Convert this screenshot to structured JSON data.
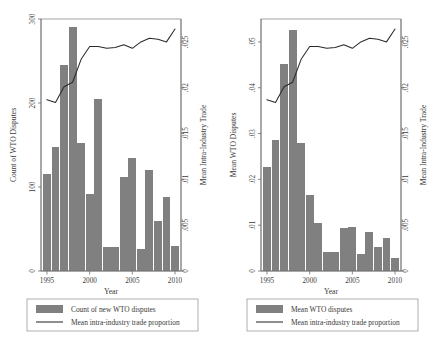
{
  "figure": {
    "background": "#ffffff",
    "bar_color": "#808080",
    "line_color": "#2a2a2a",
    "axis_color": "#6d6d6d"
  },
  "chart_data": [
    {
      "type": "bar",
      "id": "left-panel",
      "title": "",
      "xlabel": "Year",
      "ylabel": "Count of WTO Disputes",
      "y2label": "Mean Intra-Industry Trade",
      "grid": false,
      "legend_position": "below",
      "xlim": [
        1994.3,
        2010.7
      ],
      "ylim": [
        0,
        300
      ],
      "y2lim": [
        0,
        0.0275
      ],
      "xticks": [
        1995,
        2000,
        2005,
        2010
      ],
      "xticklabels": [
        "1995",
        "2000",
        "2005",
        "2010"
      ],
      "yticks": [
        0,
        100,
        200,
        300
      ],
      "yticklabels": [
        "0",
        "100",
        "200",
        "300"
      ],
      "y2ticks": [
        0,
        0.005,
        0.01,
        0.015,
        0.02,
        0.025
      ],
      "y2ticklabels": [
        "0",
        ".005",
        ".01",
        ".015",
        ".02",
        ".025"
      ],
      "categories": [
        1995,
        1996,
        1997,
        1998,
        1999,
        2000,
        2001,
        2002,
        2003,
        2004,
        2005,
        2006,
        2007,
        2008,
        2009,
        2010
      ],
      "series": [
        {
          "name": "Count of new WTO disputes",
          "kind": "bar",
          "axis": "left",
          "values": [
            115,
            148,
            245,
            290,
            152,
            92,
            205,
            28,
            28,
            112,
            135,
            26,
            120,
            60,
            88,
            30
          ]
        },
        {
          "name": "Mean intra-industry trade proportion",
          "kind": "line",
          "axis": "right",
          "values": [
            0.0187,
            0.0184,
            0.0201,
            0.0206,
            0.0231,
            0.0245,
            0.0245,
            0.0243,
            0.0244,
            0.0247,
            0.0243,
            0.025,
            0.0254,
            0.0253,
            0.025,
            0.0264
          ]
        }
      ],
      "legend": [
        {
          "label": "Count of new WTO disputes",
          "marker": "swatch"
        },
        {
          "label": "Mean intra-industry trade proportion",
          "marker": "line"
        }
      ]
    },
    {
      "type": "bar",
      "id": "right-panel",
      "title": "",
      "xlabel": "Year",
      "ylabel": "Mean WTO Disputes",
      "y2label": "Mean Intra-Industry Trade",
      "grid": false,
      "legend_position": "below",
      "xlim": [
        1994.3,
        2010.7
      ],
      "ylim": [
        0,
        0.055
      ],
      "y2lim": [
        0,
        0.0275
      ],
      "xticks": [
        1995,
        2000,
        2005,
        2010
      ],
      "xticklabels": [
        "1995",
        "2000",
        "2005",
        "2010"
      ],
      "yticks": [
        0,
        0.01,
        0.02,
        0.03,
        0.04,
        0.05
      ],
      "yticklabels": [
        "0",
        ".01",
        ".02",
        ".03",
        ".04",
        ".05"
      ],
      "y2ticks": [
        0,
        0.005,
        0.01,
        0.015,
        0.02,
        0.025
      ],
      "y2ticklabels": [
        "0",
        ".005",
        ".01",
        ".015",
        ".02",
        ".025"
      ],
      "categories": [
        1995,
        1996,
        1997,
        1998,
        1999,
        2000,
        2001,
        2002,
        2003,
        2004,
        2005,
        2006,
        2007,
        2008,
        2009,
        2010
      ],
      "series": [
        {
          "name": "Mean WTO disputes",
          "kind": "bar",
          "axis": "left",
          "values": [
            0.0228,
            0.0285,
            0.0452,
            0.0525,
            0.028,
            0.0165,
            0.0105,
            0.0042,
            0.0042,
            0.0093,
            0.0097,
            0.0038,
            0.0085,
            0.0052,
            0.0072,
            0.0028
          ]
        },
        {
          "name": "Mean intra-industry trade proportion",
          "kind": "line",
          "axis": "right",
          "values": [
            0.0187,
            0.0184,
            0.0201,
            0.0206,
            0.0231,
            0.0245,
            0.0245,
            0.0243,
            0.0244,
            0.0247,
            0.0243,
            0.025,
            0.0254,
            0.0253,
            0.025,
            0.0264
          ]
        }
      ],
      "legend": [
        {
          "label": "Mean WTO disputes",
          "marker": "swatch"
        },
        {
          "label": "Mean intra-industry trade proportion",
          "marker": "line"
        }
      ]
    }
  ]
}
